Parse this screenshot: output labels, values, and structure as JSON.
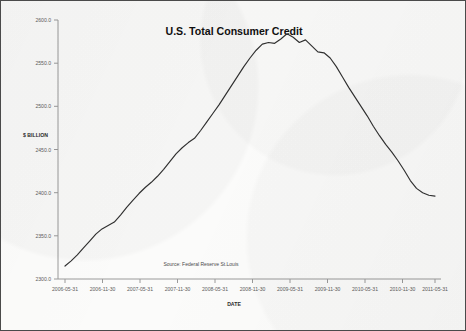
{
  "chart_data": {
    "type": "line",
    "title": "U.S. Total Consumer Credit",
    "xlabel": "DATE",
    "ylabel": "$ BILLION",
    "source_note": "Source: Federal Reserve St.Louis",
    "grid": false,
    "legend": "none",
    "line_color": "#303030",
    "ylim": [
      2300.0,
      2600.0
    ],
    "ytick_labels": [
      "2600.0",
      "2550.0",
      "2500.0",
      "2450.0",
      "2400.0",
      "2350.0",
      "2300.0"
    ],
    "ytick_values": [
      2600.0,
      2550.0,
      2500.0,
      2450.0,
      2400.0,
      2350.0,
      2300.0
    ],
    "xtick_labels": [
      "2006-05-31",
      "2006-11-30",
      "2007-05-31",
      "2007-11-30",
      "2008-05-31",
      "2008-11-30",
      "2009-05-31",
      "2009-11-30",
      "2010-05-31",
      "2010-11-30",
      "2011-05-31"
    ],
    "series": [
      {
        "name": "U.S. Total Consumer Credit",
        "x": [
          "2006-05-31",
          "2006-06-30",
          "2006-07-31",
          "2006-08-31",
          "2006-09-30",
          "2006-10-31",
          "2006-11-30",
          "2006-12-31",
          "2007-01-31",
          "2007-02-28",
          "2007-03-31",
          "2007-04-30",
          "2007-05-31",
          "2007-06-30",
          "2007-07-31",
          "2007-08-31",
          "2007-09-30",
          "2007-10-31",
          "2007-11-30",
          "2007-12-31",
          "2008-01-31",
          "2008-02-29",
          "2008-03-31",
          "2008-04-30",
          "2008-05-31",
          "2008-06-30",
          "2008-07-31",
          "2008-08-31",
          "2008-09-30",
          "2008-10-31",
          "2008-11-30",
          "2008-12-31",
          "2009-01-31",
          "2009-02-28",
          "2009-03-31",
          "2009-04-30",
          "2009-05-31",
          "2009-06-30",
          "2009-07-31",
          "2009-08-31",
          "2009-09-30",
          "2009-10-31",
          "2009-11-30",
          "2009-12-31",
          "2010-01-31",
          "2010-02-28",
          "2010-03-31",
          "2010-04-30",
          "2010-05-31",
          "2010-06-30",
          "2010-07-31",
          "2010-08-31",
          "2010-09-30",
          "2010-10-31",
          "2010-11-30",
          "2010-12-31",
          "2011-01-31",
          "2011-02-28",
          "2011-03-31",
          "2011-04-30",
          "2011-05-31"
        ],
        "values": [
          2315.0,
          2321.0,
          2328.0,
          2336.0,
          2344.0,
          2352.0,
          2358.0,
          2362.0,
          2366.0,
          2374.0,
          2383.0,
          2391.0,
          2399.0,
          2406.0,
          2412.0,
          2419.0,
          2427.0,
          2436.0,
          2445.0,
          2452.0,
          2458.0,
          2463.0,
          2472.0,
          2482.0,
          2492.0,
          2502.0,
          2513.0,
          2524.0,
          2535.0,
          2546.0,
          2556.0,
          2565.0,
          2572.0,
          2574.0,
          2573.0,
          2578.0,
          2584.0,
          2580.0,
          2574.0,
          2577.0,
          2570.0,
          2563.0,
          2562.0,
          2556.0,
          2546.0,
          2534.0,
          2522.0,
          2511.0,
          2500.0,
          2489.0,
          2477.0,
          2466.0,
          2456.0,
          2447.0,
          2437.0,
          2426.0,
          2414.0,
          2405.0,
          2400.0,
          2397.0,
          2396.0
        ]
      }
    ],
    "extra_points": {
      "trough_value": 2395.0,
      "trough_date": "2010-11-30",
      "recovery_end_value": 2455.0,
      "peak_value": 2585.0
    }
  }
}
